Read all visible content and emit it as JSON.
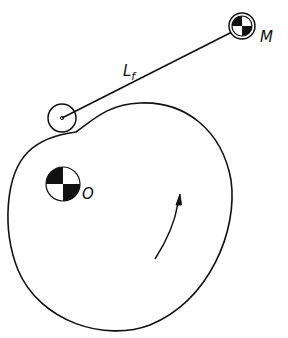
{
  "diagram": {
    "type": "cam-follower mechanism",
    "labels": {
      "moon_label": "M",
      "origin_label": "O",
      "link_label_main": "L",
      "link_label_sub": "f"
    },
    "elements": {
      "cam": {
        "description": "irregular cam profile rotating about O"
      },
      "follower_roller": {
        "center": [
          62,
          118
        ],
        "radius": 14
      },
      "link": {
        "from": [
          62,
          118
        ],
        "to": [
          240,
          28
        ]
      },
      "pivot_M": {
        "center": [
          242,
          26
        ],
        "radius": 12
      },
      "center_O": {
        "center": [
          63,
          184
        ],
        "radius": 17
      },
      "rotation_arrow": {
        "direction": "counter-clockwise upward"
      }
    },
    "colors": {
      "stroke": "#111111",
      "background": "#ffffff"
    }
  }
}
